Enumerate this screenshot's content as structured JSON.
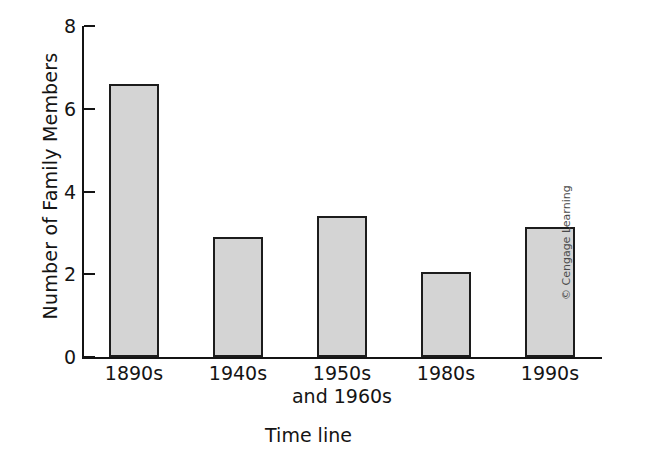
{
  "chart_data": {
    "type": "bar",
    "title": "",
    "xlabel": "Time line",
    "ylabel": "Number of Family Members",
    "categories": [
      "1890s",
      "1940s",
      "1950s and 1960s",
      "1980s",
      "1990s"
    ],
    "category_lines": [
      [
        "1890s"
      ],
      [
        "1940s"
      ],
      [
        "1950s",
        "and 1960s"
      ],
      [
        "1980s"
      ],
      [
        "1990s"
      ]
    ],
    "values": [
      6.6,
      2.9,
      3.4,
      2.05,
      3.15
    ],
    "ylim": [
      0,
      8
    ],
    "yticks": [
      0,
      2,
      4,
      6,
      8
    ],
    "ytick_labels": [
      "0",
      "2",
      "4",
      "6",
      "8"
    ],
    "grid": false,
    "legend": false,
    "bar_fill_color": "#d4d4d4",
    "bar_border_color": "#1c1c1c",
    "axis_color": "#141414"
  },
  "credit": {
    "text": "© Cengage Learning"
  }
}
